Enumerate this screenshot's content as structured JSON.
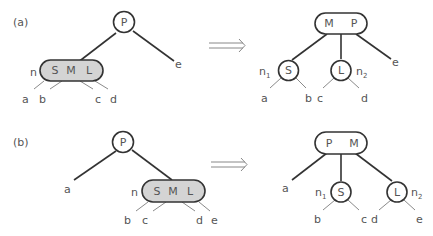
{
  "panels": [
    {
      "label": "(a)",
      "before": {
        "parent": "P",
        "overflow_node_name": "n",
        "overflow_keys": [
          "S",
          "M",
          "L"
        ],
        "children": [
          "a",
          "b",
          "c",
          "d"
        ],
        "parent_right_child": "e"
      },
      "after": {
        "parent_keys": [
          "M",
          "P"
        ],
        "left_node": "S",
        "left_node_name": "n",
        "left_node_sub": "1",
        "right_node": "L",
        "right_node_name": "n",
        "right_node_sub": "2",
        "left_children": [
          "a",
          "b"
        ],
        "right_children": [
          "c",
          "d"
        ],
        "parent_right_child": "e"
      }
    },
    {
      "label": "(b)",
      "before": {
        "parent": "P",
        "parent_left_child": "a",
        "overflow_node_name": "n",
        "overflow_keys": [
          "S",
          "M",
          "L"
        ],
        "children": [
          "b",
          "c",
          "d",
          "e"
        ]
      },
      "after": {
        "parent_keys": [
          "P",
          "M"
        ],
        "parent_left_child": "a",
        "left_node": "S",
        "left_node_name": "n",
        "left_node_sub": "1",
        "right_node": "L",
        "right_node_name": "n",
        "right_node_sub": "2",
        "left_children": [
          "b",
          "c"
        ],
        "right_children": [
          "d",
          "e"
        ]
      }
    }
  ],
  "arrow": "⟹"
}
